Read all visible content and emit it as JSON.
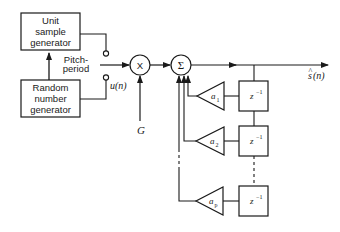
{
  "diagram": {
    "type": "block-diagram",
    "title": "",
    "blocks": {
      "unit_sample": {
        "lines": [
          "Unit",
          "sample",
          "generator"
        ]
      },
      "random_number": {
        "lines": [
          "Random",
          "number",
          "generator"
        ]
      },
      "multiplier": {
        "symbol": "X"
      },
      "summer": {
        "symbol": "Σ"
      },
      "delays": [
        {
          "label": "z",
          "exp": "−1"
        },
        {
          "label": "z",
          "exp": "−1"
        },
        {
          "label": "z",
          "exp": "−1"
        }
      ],
      "gains": [
        {
          "label": "a",
          "sub": "1"
        },
        {
          "label": "a",
          "sub": "2"
        },
        {
          "label": "a",
          "sub": "p"
        }
      ]
    },
    "labels": {
      "pitch_line1": "Pitch-",
      "pitch_line2": "period",
      "excitation": "u(n)",
      "gain": "G",
      "output_s": "s",
      "output_hat": "^",
      "output_arg": "(n)"
    },
    "colors": {
      "stroke": "#1a1a1a",
      "background": "#ffffff"
    }
  }
}
